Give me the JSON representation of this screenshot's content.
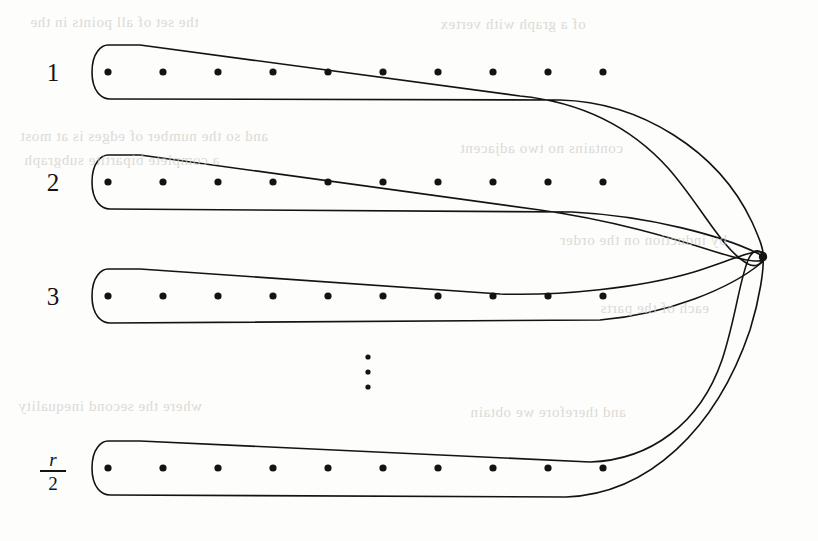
{
  "figure": {
    "background_color": "#fdfdfc",
    "ink_color": "#131313",
    "stroke_width": 1.6,
    "dot_radius": 3.6,
    "apex_dot_radius": 4.2,
    "row_count_visible": 4,
    "dots_per_row": 10,
    "dot_start_x": 108,
    "dot_spacing_x": 55,
    "apex": {
      "x": 763,
      "y": 257,
      "label": "shared-apex-vertex"
    },
    "rows": [
      {
        "id": "row-1",
        "label": "1",
        "label_kind": "integer",
        "label_x": 52,
        "label_y": 72,
        "dot_y": 72,
        "ellipse_left_x": 92,
        "ellipse_half_height": 27,
        "dots_x": [
          108,
          163,
          218,
          273,
          328,
          383,
          438,
          493,
          548,
          603
        ]
      },
      {
        "id": "row-2",
        "label": "2",
        "label_kind": "integer",
        "label_x": 52,
        "label_y": 182,
        "dot_y": 182,
        "ellipse_left_x": 92,
        "ellipse_half_height": 27,
        "dots_x": [
          108,
          163,
          218,
          273,
          328,
          383,
          438,
          493,
          548,
          603
        ]
      },
      {
        "id": "row-3",
        "label": "3",
        "label_kind": "integer",
        "label_x": 52,
        "label_y": 296,
        "dot_y": 296,
        "ellipse_left_x": 92,
        "ellipse_half_height": 27,
        "dots_x": [
          108,
          163,
          218,
          273,
          328,
          383,
          438,
          493,
          548,
          603
        ]
      },
      {
        "id": "row-last",
        "label_kind": "fraction",
        "label_numerator": "r",
        "label_denominator": "2",
        "label_x": 52,
        "label_y": 468,
        "dot_y": 468,
        "ellipse_left_x": 92,
        "ellipse_half_height": 27,
        "dots_x": [
          108,
          163,
          218,
          273,
          328,
          383,
          438,
          493,
          548,
          603
        ]
      }
    ],
    "vertical_ellipsis": {
      "label": "vertical-dots",
      "x": 368,
      "dots_y": [
        357,
        372,
        387
      ],
      "dot_radius": 2.6
    },
    "bleed_through_text": [
      {
        "text": "the set of all  points  in the",
        "x": 30,
        "y": 14
      },
      {
        "text": "of a  graph  with  vertex",
        "x": 440,
        "y": 16
      },
      {
        "text": "and  so  the  number  of  edges  is  at  most",
        "x": 20,
        "y": 128
      },
      {
        "text": "a  complete  bipartite  subgraph",
        "x": 24,
        "y": 152
      },
      {
        "text": "contains  no  two  adjacent",
        "x": 460,
        "y": 140
      },
      {
        "text": "where  the  second  inequality",
        "x": 18,
        "y": 398
      },
      {
        "text": "and  therefore  we  obtain",
        "x": 470,
        "y": 404
      },
      {
        "text": "by  induction  on  the  order",
        "x": 560,
        "y": 232
      },
      {
        "text": "each  of  the  parts",
        "x": 600,
        "y": 300
      }
    ]
  }
}
